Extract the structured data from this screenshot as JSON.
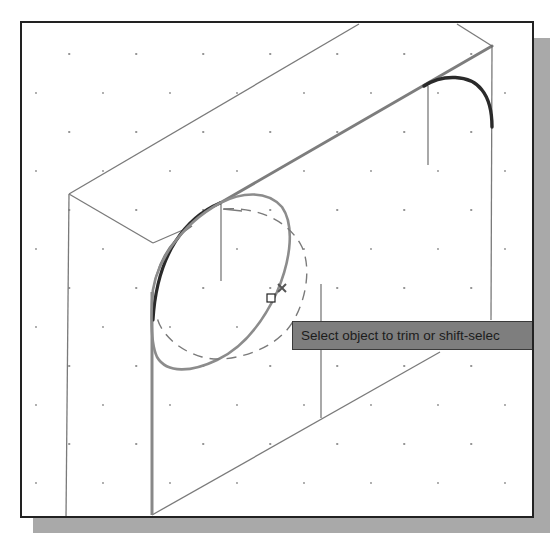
{
  "viewport": {
    "background": "#ffffff",
    "border_color": "#222222",
    "shadow_color": "#a9a9a9",
    "grid": {
      "type": "isometric-dots",
      "dot_color": "#8a8a8a"
    }
  },
  "drawing": {
    "description": "Isometric box with fillet arcs being trimmed",
    "line_color": "#777777",
    "highlight_color": "#2a2a2a",
    "selection_color": "#8c8c8c"
  },
  "cursor": {
    "pickbox": "square-pickbox",
    "marker": "x-marker"
  },
  "tooltip": {
    "text": "Select object to trim or shift-selec",
    "background": "#7e7e7e"
  }
}
